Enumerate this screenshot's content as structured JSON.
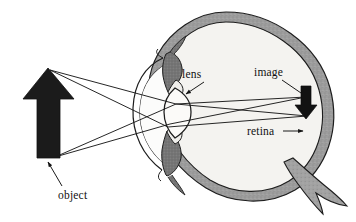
{
  "diagram": {
    "labels": {
      "lens": "lens",
      "image": "image",
      "retina": "retina",
      "object": "object"
    },
    "colors": {
      "outline": "#1a1a1a",
      "sclera_wall": "#9a9a9a",
      "sclera_wall_dark": "#7e7e7e",
      "vitreous_fill": "#f2f1ee",
      "anterior_fill": "#fbfbfa",
      "iris_fill": "#6e6e6e",
      "object_arrow": "#1a1a1a",
      "image_arrow": "#111111",
      "ray_line": "#1a1a1a",
      "background": "#ffffff"
    },
    "parts": [
      {
        "name": "object-arrow",
        "label": "object",
        "description": "large upright black arrow at left representing the object"
      },
      {
        "name": "light-rays",
        "label": "",
        "description": "four straight rays from object tip and base through the lens"
      },
      {
        "name": "cornea",
        "label": "",
        "description": "transparent front curve of the eye"
      },
      {
        "name": "iris-ciliary-body",
        "label": "",
        "description": "dark grey wedges above and below the lens"
      },
      {
        "name": "lens",
        "label": "lens",
        "description": "biconvex lens behind the iris"
      },
      {
        "name": "retina",
        "label": "retina",
        "description": "thick grey inner wall lining the back of the eye"
      },
      {
        "name": "optic-nerve",
        "label": "",
        "description": "nerve bundle exiting the lower right of the eyeball"
      },
      {
        "name": "image-arrow",
        "label": "image",
        "description": "small inverted black arrow formed on the retina"
      }
    ],
    "label_positions": {
      "lens": {
        "x": 182,
        "y": 78
      },
      "image": {
        "x": 254,
        "y": 76
      },
      "retina": {
        "x": 247,
        "y": 135
      },
      "object": {
        "x": 58,
        "y": 199
      }
    }
  }
}
